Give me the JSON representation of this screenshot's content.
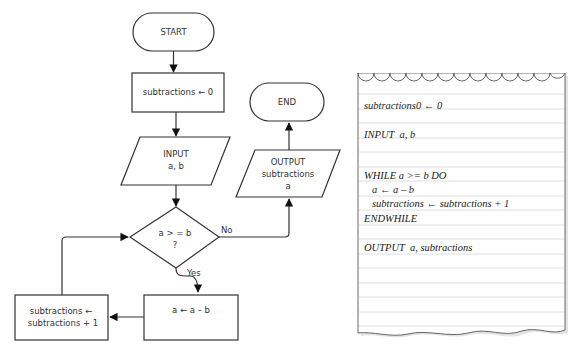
{
  "flowchart": {
    "start_label": "START",
    "init_label": "subtractions ← 0",
    "input_label_line1": "INPUT",
    "input_label_line2": "a, b",
    "decision_line1": "a > = b",
    "decision_line2": "?",
    "yes_label": "Yes",
    "no_label": "No",
    "subtract_label": "a ← a – b",
    "increment_line1": "subtractions ←",
    "increment_line2": "subtractions + 1",
    "output_line1": "OUTPUT",
    "output_line2": "subtractions",
    "output_line3": "a",
    "end_label": "END",
    "colors": {
      "stroke": "#333333",
      "fill": "#ffffff",
      "text": "#333333"
    }
  },
  "pseudocode_note": {
    "lines": [
      "subtractions0 ← 0",
      "INPUT  a, b",
      "WHILE a >= b DO",
      "  a ← a – b",
      "  subtractions ← subtractions + 1",
      "ENDWHILE",
      "OUTPUT  a, subtractions"
    ],
    "colors": {
      "paper": "#ffffff",
      "rule": "#d6d6d6",
      "border": "#555555",
      "text": "#222222"
    }
  }
}
